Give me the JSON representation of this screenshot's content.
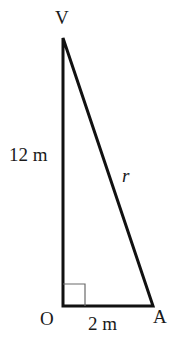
{
  "diagram": {
    "type": "right-triangle",
    "points": {
      "V": {
        "label": "V",
        "x": 63,
        "y": 38
      },
      "O": {
        "label": "O",
        "x": 63,
        "y": 306
      },
      "A": {
        "label": "A",
        "x": 153,
        "y": 306
      }
    },
    "sides": {
      "VO": {
        "label": "12 m"
      },
      "OA": {
        "label": "2 m"
      },
      "VA": {
        "label": "r"
      }
    },
    "right_angle_at": "O",
    "colors": {
      "stroke": "#111111",
      "right_angle_marker": "#6a6a6a",
      "text": "#1a1a1a"
    }
  }
}
